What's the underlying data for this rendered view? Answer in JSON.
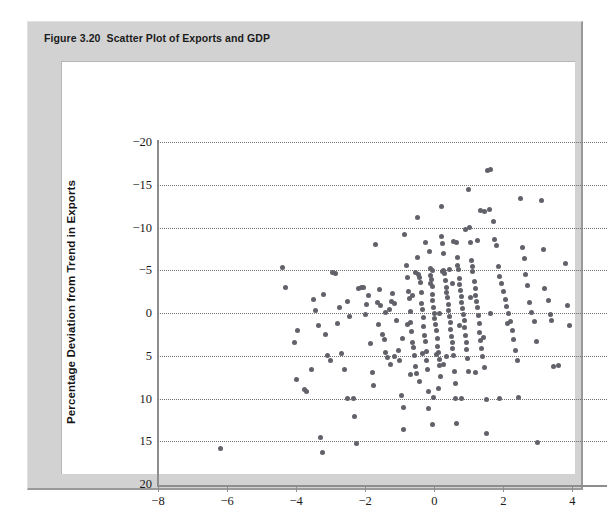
{
  "figure": {
    "number": "Figure 3.20",
    "caption": "Scatter Plot of Exports and GDP"
  },
  "chart_data": {
    "type": "scatter",
    "title": "Scatter Plot of Exports and GDP",
    "xlabel": "Percentage Deviation from Trend in Real GDP",
    "ylabel": "Percentage Deviation from Trend in Exports",
    "xlim": [
      -8,
      5
    ],
    "ylim": [
      -20,
      20
    ],
    "xticks": [
      -8,
      -6,
      -4,
      -2,
      0,
      2,
      4
    ],
    "yticks": [
      -20,
      -15,
      -10,
      -5,
      0,
      5,
      10,
      15,
      20
    ],
    "grid": "horizontal-dotted",
    "legend": null,
    "marker": {
      "shape": "circle",
      "color": "#61616a",
      "size": 5
    },
    "points": [
      [
        -6.2,
        -15.9
      ],
      [
        -4.4,
        5.3
      ],
      [
        -4.3,
        3.0
      ],
      [
        -4.05,
        -3.4
      ],
      [
        -3.95,
        -2.0
      ],
      [
        -4.0,
        -7.8
      ],
      [
        -3.75,
        -8.9
      ],
      [
        -3.7,
        -9.2
      ],
      [
        -3.55,
        -6.6
      ],
      [
        -3.5,
        1.6
      ],
      [
        -3.45,
        0.3
      ],
      [
        -3.35,
        -1.5
      ],
      [
        -3.3,
        -14.6
      ],
      [
        -3.25,
        -16.3
      ],
      [
        -3.2,
        2.2
      ],
      [
        -3.15,
        -2.5
      ],
      [
        -3.1,
        -5.0
      ],
      [
        -3.0,
        -5.6
      ],
      [
        -2.95,
        4.7
      ],
      [
        -2.85,
        4.6
      ],
      [
        -2.8,
        -1.2
      ],
      [
        -2.75,
        0.6
      ],
      [
        -2.7,
        -4.7
      ],
      [
        -2.6,
        -6.6
      ],
      [
        -2.5,
        1.3
      ],
      [
        -2.45,
        -0.4
      ],
      [
        -2.35,
        -10.0
      ],
      [
        -2.3,
        -12.1
      ],
      [
        -2.25,
        -15.3
      ],
      [
        -2.2,
        2.9
      ],
      [
        -2.1,
        3.0
      ],
      [
        -2.05,
        2.95
      ],
      [
        -2.0,
        -0.2
      ],
      [
        -1.95,
        1.0
      ],
      [
        -1.9,
        2.1
      ],
      [
        -1.85,
        -3.6
      ],
      [
        -1.8,
        -7.0
      ],
      [
        -1.75,
        -8.5
      ],
      [
        -1.7,
        8.0
      ],
      [
        -1.65,
        1.2
      ],
      [
        -1.6,
        2.7
      ],
      [
        -1.55,
        0.9
      ],
      [
        -1.5,
        -2.5
      ],
      [
        -1.45,
        -3.1
      ],
      [
        -1.4,
        -4.6
      ],
      [
        -1.35,
        -5.2
      ],
      [
        -1.3,
        0.4
      ],
      [
        -1.25,
        1.4
      ],
      [
        -1.2,
        2.3
      ],
      [
        -1.15,
        1.15
      ],
      [
        -1.1,
        -0.9
      ],
      [
        -1.05,
        -4.4
      ],
      [
        -1.0,
        -5.5
      ],
      [
        -0.95,
        -9.7
      ],
      [
        -0.9,
        -11.0
      ],
      [
        -0.9,
        -13.6
      ],
      [
        -0.85,
        9.2
      ],
      [
        -0.8,
        5.6
      ],
      [
        -0.78,
        4.1
      ],
      [
        -0.75,
        2.5
      ],
      [
        -0.72,
        1.7
      ],
      [
        -0.7,
        0.2
      ],
      [
        -0.68,
        -1.1
      ],
      [
        -0.65,
        -2.2
      ],
      [
        -0.62,
        -3.4
      ],
      [
        -0.6,
        -4.0
      ],
      [
        -0.58,
        -5.0
      ],
      [
        -0.55,
        -6.3
      ],
      [
        -0.52,
        -7.1
      ],
      [
        -0.5,
        11.2
      ],
      [
        -0.48,
        6.5
      ],
      [
        -0.45,
        4.5
      ],
      [
        -0.42,
        4.2
      ],
      [
        -0.4,
        3.6
      ],
      [
        -0.38,
        2.4
      ],
      [
        -0.36,
        1.1
      ],
      [
        -0.34,
        0.45
      ],
      [
        -0.32,
        -0.5
      ],
      [
        -0.3,
        -1.6
      ],
      [
        -0.28,
        -2.6
      ],
      [
        -0.26,
        -3.3
      ],
      [
        -0.24,
        -4.5
      ],
      [
        -0.22,
        -5.5
      ],
      [
        -0.2,
        -6.6
      ],
      [
        -0.18,
        -9.2
      ],
      [
        -0.16,
        -11.2
      ],
      [
        -0.15,
        7.2
      ],
      [
        -0.12,
        5.2
      ],
      [
        -0.1,
        4.4
      ],
      [
        -0.08,
        3.9
      ],
      [
        -0.06,
        3.1
      ],
      [
        -0.05,
        2.2
      ],
      [
        -0.04,
        1.5
      ],
      [
        -0.02,
        0.7
      ],
      [
        0.0,
        0.0
      ],
      [
        0.02,
        -0.7
      ],
      [
        0.04,
        -1.4
      ],
      [
        0.06,
        -2.1
      ],
      [
        0.08,
        -3.0
      ],
      [
        0.1,
        -3.9
      ],
      [
        0.12,
        -4.6
      ],
      [
        0.14,
        -5.4
      ],
      [
        0.16,
        -6.1
      ],
      [
        0.18,
        -7.4
      ],
      [
        0.2,
        12.4
      ],
      [
        0.22,
        9.0
      ],
      [
        0.24,
        8.1
      ],
      [
        0.26,
        7.0
      ],
      [
        0.28,
        5.0
      ],
      [
        0.3,
        4.6
      ],
      [
        0.32,
        3.8
      ],
      [
        0.34,
        3.0
      ],
      [
        0.36,
        2.4
      ],
      [
        0.38,
        1.8
      ],
      [
        0.4,
        1.0
      ],
      [
        0.42,
        0.3
      ],
      [
        0.44,
        -0.4
      ],
      [
        0.46,
        -1.1
      ],
      [
        0.48,
        -1.9
      ],
      [
        0.5,
        -2.7
      ],
      [
        0.52,
        -3.5
      ],
      [
        0.54,
        -4.2
      ],
      [
        0.56,
        -5.0
      ],
      [
        0.58,
        -6.8
      ],
      [
        0.6,
        -8.2
      ],
      [
        0.62,
        -10.0
      ],
      [
        0.64,
        8.2
      ],
      [
        0.66,
        6.5
      ],
      [
        0.68,
        5.5
      ],
      [
        0.7,
        5.1
      ],
      [
        0.72,
        4.0
      ],
      [
        0.74,
        3.3
      ],
      [
        0.76,
        2.6
      ],
      [
        0.78,
        1.9
      ],
      [
        0.8,
        1.2
      ],
      [
        0.82,
        0.5
      ],
      [
        0.84,
        -0.2
      ],
      [
        0.86,
        -0.9
      ],
      [
        0.88,
        -1.7
      ],
      [
        0.9,
        -2.6
      ],
      [
        0.92,
        -3.4
      ],
      [
        0.94,
        -4.3
      ],
      [
        0.96,
        -5.3
      ],
      [
        0.98,
        -6.9
      ],
      [
        1.0,
        14.4
      ],
      [
        1.02,
        10.0
      ],
      [
        1.05,
        8.3
      ],
      [
        1.08,
        6.1
      ],
      [
        1.1,
        5.4
      ],
      [
        1.12,
        4.8
      ],
      [
        1.15,
        3.7
      ],
      [
        1.18,
        2.9
      ],
      [
        1.2,
        2.0
      ],
      [
        1.22,
        1.3
      ],
      [
        1.25,
        0.6
      ],
      [
        1.28,
        -0.3
      ],
      [
        1.3,
        -1.2
      ],
      [
        1.32,
        -2.3
      ],
      [
        1.35,
        -3.2
      ],
      [
        1.38,
        -4.1
      ],
      [
        1.4,
        -5.1
      ],
      [
        1.45,
        -6.4
      ],
      [
        1.5,
        -10.1
      ],
      [
        1.52,
        -14.1
      ],
      [
        1.55,
        16.7
      ],
      [
        1.62,
        16.8
      ],
      [
        1.35,
        12.0
      ],
      [
        1.45,
        11.9
      ],
      [
        1.6,
        12.1
      ],
      [
        1.7,
        10.7
      ],
      [
        1.75,
        8.6
      ],
      [
        1.8,
        7.9
      ],
      [
        1.85,
        5.4
      ],
      [
        1.9,
        4.3
      ],
      [
        1.95,
        3.4
      ],
      [
        2.0,
        2.5
      ],
      [
        2.05,
        1.6
      ],
      [
        2.1,
        0.8
      ],
      [
        2.15,
        -0.1
      ],
      [
        2.2,
        -1.0
      ],
      [
        2.25,
        -2.0
      ],
      [
        2.3,
        -3.1
      ],
      [
        2.35,
        -4.4
      ],
      [
        2.4,
        -5.6
      ],
      [
        2.45,
        -9.9
      ],
      [
        2.5,
        13.4
      ],
      [
        2.55,
        7.7
      ],
      [
        2.6,
        6.4
      ],
      [
        2.65,
        4.5
      ],
      [
        2.7,
        3.2
      ],
      [
        2.75,
        1.2
      ],
      [
        2.8,
        0.1
      ],
      [
        2.9,
        -1.0
      ],
      [
        2.95,
        -3.3
      ],
      [
        3.0,
        -15.2
      ],
      [
        3.1,
        13.1
      ],
      [
        3.15,
        7.4
      ],
      [
        3.2,
        2.9
      ],
      [
        3.3,
        1.5
      ],
      [
        3.35,
        -0.2
      ],
      [
        3.4,
        -0.9
      ],
      [
        3.45,
        -6.2
      ],
      [
        3.6,
        -6.1
      ],
      [
        3.8,
        5.8
      ],
      [
        3.85,
        0.9
      ],
      [
        3.9,
        -1.5
      ],
      [
        0.15,
        -0.05
      ],
      [
        0.45,
        5.05
      ],
      [
        -0.05,
        5.0
      ],
      [
        0.25,
        4.9
      ],
      [
        -0.55,
        4.75
      ],
      [
        0.05,
        -4.9
      ],
      [
        -0.35,
        -4.75
      ],
      [
        0.35,
        -5.05
      ],
      [
        -1.15,
        -5.1
      ],
      [
        0.9,
        9.8
      ],
      [
        1.25,
        8.5
      ],
      [
        0.55,
        8.4
      ],
      [
        -0.25,
        8.3
      ],
      [
        -0.42,
        -8.0
      ],
      [
        0.12,
        -8.8
      ],
      [
        -0.02,
        -9.9
      ],
      [
        0.78,
        -9.95
      ],
      [
        1.88,
        -10.0
      ],
      [
        -2.5,
        -9.95
      ],
      [
        -0.05,
        -13.0
      ],
      [
        0.65,
        -12.9
      ],
      [
        -0.12,
        3.45
      ],
      [
        0.52,
        3.5
      ],
      [
        -0.62,
        2.05
      ],
      [
        1.05,
        1.85
      ],
      [
        -1.42,
        0.05
      ],
      [
        1.62,
        -0.05
      ],
      [
        -0.78,
        -1.35
      ],
      [
        0.72,
        -1.45
      ],
      [
        -1.62,
        -1.3
      ],
      [
        2.12,
        -1.2
      ],
      [
        -0.92,
        -2.95
      ],
      [
        1.42,
        -2.85
      ],
      [
        -1.28,
        -6.0
      ],
      [
        0.28,
        -6.05
      ],
      [
        1.18,
        -7.0
      ],
      [
        -0.68,
        -7.2
      ]
    ]
  },
  "axes": {
    "y_tick_labels": [
      "20",
      "15",
      "10",
      "5",
      "0",
      "−5",
      "−10",
      "−15",
      "−20"
    ],
    "x_tick_labels": [
      "−8",
      "−6",
      "−4",
      "−2",
      "0",
      "2",
      "4"
    ]
  }
}
